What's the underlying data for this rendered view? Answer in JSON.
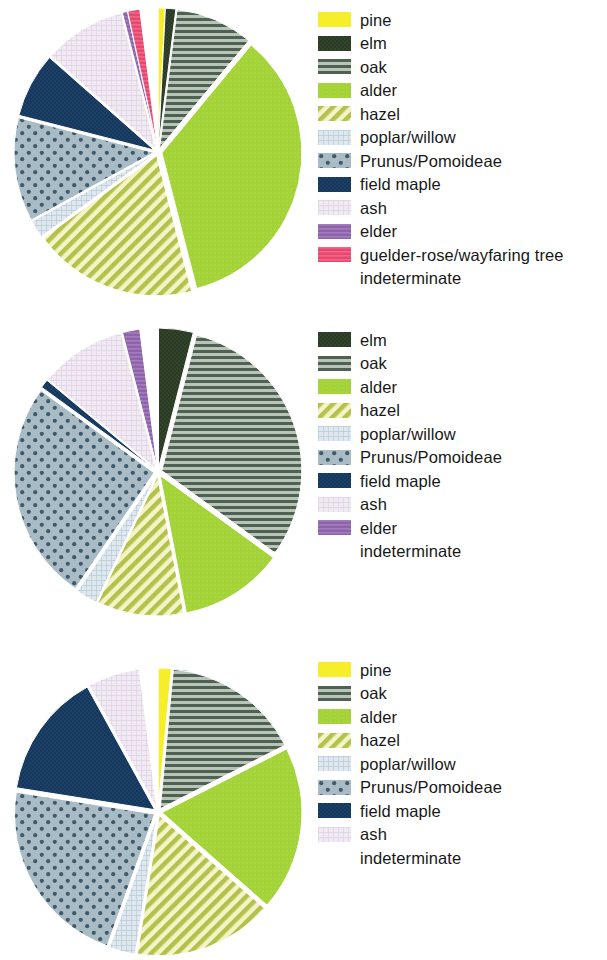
{
  "figure": {
    "panels": [
      {
        "id": "panel-1",
        "pie": {
          "center": [
            152,
            152
          ],
          "radius": 140,
          "slices": [
            {
              "taxon": "pine",
              "percent": 0.8,
              "explode": 4
            },
            {
              "taxon": "elm",
              "percent": 1.2,
              "explode": 4
            },
            {
              "taxon": "oak",
              "percent": 9.0,
              "explode": 4
            },
            {
              "taxon": "alder",
              "percent": 35.0,
              "explode": 4
            },
            {
              "taxon": "hazel",
              "percent": 19.0,
              "explode": 4
            },
            {
              "taxon": "poplar/willow",
              "percent": 2.0,
              "explode": 4
            },
            {
              "taxon": "Prunus/Pomoideae",
              "percent": 12.0,
              "explode": 4
            },
            {
              "taxon": "field maple",
              "percent": 7.5,
              "explode": 4
            },
            {
              "taxon": "ash",
              "percent": 9.5,
              "explode": 4
            },
            {
              "taxon": "elder",
              "percent": 0.6,
              "explode": 4
            },
            {
              "taxon": "guelder-rose/wayfaring tree",
              "percent": 1.4,
              "explode": 4
            },
            {
              "taxon": "indeterminate",
              "percent": 2.0,
              "explode": 4
            }
          ]
        },
        "legend": [
          {
            "label": "pine",
            "pattern": "pine"
          },
          {
            "label": "elm",
            "pattern": "elm"
          },
          {
            "label": "oak",
            "pattern": "oak"
          },
          {
            "label": "alder",
            "pattern": "alder"
          },
          {
            "label": "hazel",
            "pattern": "hazel"
          },
          {
            "label": "poplar/willow",
            "pattern": "poplar"
          },
          {
            "label": "Prunus/Pomoideae",
            "pattern": "prunus"
          },
          {
            "label": "field maple",
            "pattern": "maple"
          },
          {
            "label": "ash",
            "pattern": "ash"
          },
          {
            "label": "elder",
            "pattern": "elder"
          },
          {
            "label": "guelder-rose/wayfaring tree",
            "pattern": "guelder"
          },
          {
            "label": "indeterminate",
            "pattern": "none"
          }
        ]
      },
      {
        "id": "panel-2",
        "pie": {
          "center": [
            152,
            152
          ],
          "radius": 140,
          "slices": [
            {
              "taxon": "elm",
              "percent": 4.0,
              "explode": 4
            },
            {
              "taxon": "oak",
              "percent": 31.0,
              "explode": 4
            },
            {
              "taxon": "alder",
              "percent": 12.0,
              "explode": 4
            },
            {
              "taxon": "hazel",
              "percent": 10.0,
              "explode": 4
            },
            {
              "taxon": "poplar/willow",
              "percent": 2.5,
              "explode": 4
            },
            {
              "taxon": "Prunus/Pomoideae",
              "percent": 25.5,
              "explode": 4
            },
            {
              "taxon": "field maple",
              "percent": 1.0,
              "explode": 4
            },
            {
              "taxon": "ash",
              "percent": 10.0,
              "explode": 4
            },
            {
              "taxon": "elder",
              "percent": 2.0,
              "explode": 4
            },
            {
              "taxon": "indeterminate",
              "percent": 2.0,
              "explode": 4
            }
          ]
        },
        "legend": [
          {
            "label": "elm",
            "pattern": "elm"
          },
          {
            "label": "oak",
            "pattern": "oak"
          },
          {
            "label": "alder",
            "pattern": "alder"
          },
          {
            "label": "hazel",
            "pattern": "hazel"
          },
          {
            "label": "poplar/willow",
            "pattern": "poplar"
          },
          {
            "label": "Prunus/Pomoideae",
            "pattern": "prunus"
          },
          {
            "label": "field maple",
            "pattern": "maple"
          },
          {
            "label": "ash",
            "pattern": "ash"
          },
          {
            "label": "elder",
            "pattern": "elder"
          },
          {
            "label": "indeterminate",
            "pattern": "none"
          }
        ]
      },
      {
        "id": "panel-3",
        "pie": {
          "center": [
            152,
            162
          ],
          "radius": 140,
          "slices": [
            {
              "taxon": "pine",
              "percent": 1.5,
              "explode": 4
            },
            {
              "taxon": "oak",
              "percent": 16.0,
              "explode": 4
            },
            {
              "taxon": "alder",
              "percent": 19.0,
              "explode": 4
            },
            {
              "taxon": "hazel",
              "percent": 16.0,
              "explode": 4
            },
            {
              "taxon": "poplar/willow",
              "percent": 3.0,
              "explode": 4
            },
            {
              "taxon": "Prunus/Pomoideae",
              "percent": 22.0,
              "explode": 4
            },
            {
              "taxon": "field maple",
              "percent": 14.5,
              "explode": 4
            },
            {
              "taxon": "ash",
              "percent": 6.0,
              "explode": 4
            },
            {
              "taxon": "indeterminate",
              "percent": 2.0,
              "explode": 4
            }
          ]
        },
        "legend": [
          {
            "label": "pine",
            "pattern": "pine"
          },
          {
            "label": "oak",
            "pattern": "oak"
          },
          {
            "label": "alder",
            "pattern": "alder"
          },
          {
            "label": "hazel",
            "pattern": "hazel"
          },
          {
            "label": "poplar/willow",
            "pattern": "poplar"
          },
          {
            "label": "Prunus/Pomoideae",
            "pattern": "prunus"
          },
          {
            "label": "field maple",
            "pattern": "maple"
          },
          {
            "label": "ash",
            "pattern": "ash"
          },
          {
            "label": "indeterminate",
            "pattern": "none"
          }
        ]
      }
    ]
  },
  "palette": {
    "pine": "#f7ee2a",
    "elm": "#2b3a24",
    "oak_bg": "#b9c4b8",
    "oak_fg": "#4e6152",
    "alder": "#a3d337",
    "hazel_bg": "#f4f4c8",
    "hazel_fg": "#b3c24a",
    "poplar_bg": "#dfe8ee",
    "poplar_fg": "#b9cbd6",
    "prunus_bg": "#a9bcc6",
    "prunus_fg": "#3f5a6b",
    "maple": "#16375c",
    "ash_bg": "#f1eaf3",
    "ash_fg": "#ddd0e4",
    "elder": "#8e63ab",
    "guelder": "#e8486f",
    "indeterminate": "#ffffff",
    "outline": "#ffffff",
    "text": "#181818"
  },
  "chart_data": [
    {
      "type": "pie",
      "title": "",
      "index": 1,
      "legend_position": "right",
      "unit": "percent",
      "categories": [
        "pine",
        "elm",
        "oak",
        "alder",
        "hazel",
        "poplar/willow",
        "Prunus/Pomoideae",
        "field maple",
        "ash",
        "elder",
        "guelder-rose/wayfaring tree",
        "indeterminate"
      ],
      "values": [
        0.8,
        1.2,
        9.0,
        35.0,
        19.0,
        2.0,
        12.0,
        7.5,
        9.5,
        0.6,
        1.4,
        2.0
      ],
      "start_angle_deg": 0,
      "direction": "clockwise",
      "exploded": true
    },
    {
      "type": "pie",
      "title": "",
      "index": 2,
      "legend_position": "right",
      "unit": "percent",
      "categories": [
        "elm",
        "oak",
        "alder",
        "hazel",
        "poplar/willow",
        "Prunus/Pomoideae",
        "field maple",
        "ash",
        "elder",
        "indeterminate"
      ],
      "values": [
        4.0,
        31.0,
        12.0,
        10.0,
        2.5,
        25.5,
        1.0,
        10.0,
        2.0,
        2.0
      ],
      "start_angle_deg": 0,
      "direction": "clockwise",
      "exploded": true
    },
    {
      "type": "pie",
      "title": "",
      "index": 3,
      "legend_position": "right",
      "unit": "percent",
      "categories": [
        "pine",
        "oak",
        "alder",
        "hazel",
        "poplar/willow",
        "Prunus/Pomoideae",
        "field maple",
        "ash",
        "indeterminate"
      ],
      "values": [
        1.5,
        16.0,
        19.0,
        16.0,
        3.0,
        22.0,
        14.5,
        6.0,
        2.0
      ],
      "start_angle_deg": 0,
      "direction": "clockwise",
      "exploded": true
    }
  ]
}
